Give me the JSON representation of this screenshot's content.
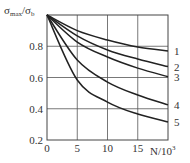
{
  "chart_data": {
    "type": "line",
    "title": "",
    "xlabel": "N/10³",
    "ylabel": "σmax/σb",
    "ylabel_parts": {
      "main1": "σ",
      "sub1": "max",
      "slash": "/",
      "main2": "σ",
      "sub2": "b"
    },
    "xlabel_parts": {
      "main": "N/10",
      "sup": "3"
    },
    "xlim": [
      0,
      20
    ],
    "ylim": [
      0.2,
      1.0
    ],
    "xticks": [
      0,
      5,
      10,
      15
    ],
    "xtick_labels": [
      "0",
      "5",
      "10",
      "15"
    ],
    "yticks": [
      0.2,
      0.4,
      0.6,
      0.8
    ],
    "ytick_labels": [
      "0.2",
      "0.4",
      "0.6",
      "0.8"
    ],
    "grid": true,
    "x": [
      0,
      5,
      10,
      15,
      20
    ],
    "series": [
      {
        "name": "1",
        "values": [
          1.0,
          0.9,
          0.84,
          0.795,
          0.77
        ]
      },
      {
        "name": "2",
        "values": [
          1.0,
          0.866,
          0.776,
          0.718,
          0.67
        ]
      },
      {
        "name": "3",
        "values": [
          1.0,
          0.827,
          0.731,
          0.66,
          0.605
        ]
      },
      {
        "name": "4",
        "values": [
          1.0,
          0.712,
          0.571,
          0.488,
          0.425
        ]
      },
      {
        "name": "5",
        "values": [
          1.0,
          0.584,
          0.443,
          0.366,
          0.315
        ]
      }
    ],
    "legend": "curve labels at right end"
  }
}
